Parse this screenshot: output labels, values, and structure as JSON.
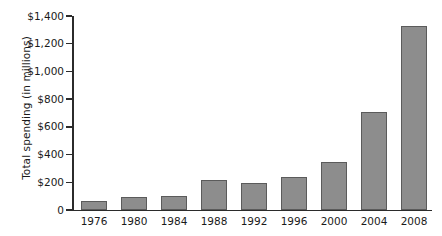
{
  "chart_data": {
    "type": "bar",
    "title": "",
    "subtitle": "",
    "xlabel": "",
    "ylabel": "Total spending (in millions)",
    "categories": [
      "1976",
      "1980",
      "1984",
      "1988",
      "1992",
      "1996",
      "2000",
      "2004",
      "2008"
    ],
    "values": [
      67,
      92,
      103,
      215,
      195,
      240,
      345,
      710,
      1330
    ],
    "ylim": [
      0,
      1400
    ],
    "ytick_values": [
      0,
      200,
      400,
      600,
      800,
      1000,
      1200,
      1400
    ],
    "ytick_labels": [
      "0",
      "$200",
      "$400",
      "$600",
      "$800",
      "$1,000",
      "$1,200",
      "$1,400"
    ],
    "grid": false,
    "legend": null,
    "bar_color": "#8d8d8d",
    "bar_edge_color": "#5b5b5b",
    "axis_color": "#2b2b2b",
    "background_color": "#ffffff"
  }
}
